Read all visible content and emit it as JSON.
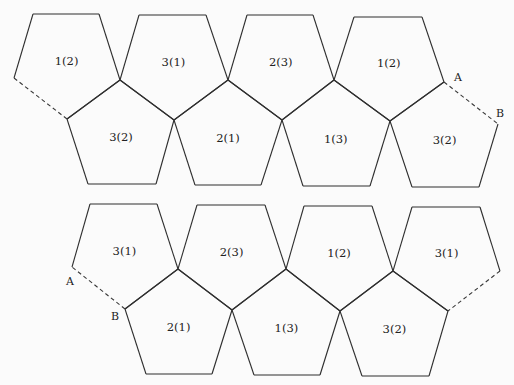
{
  "diagram": {
    "type": "pentagon-net",
    "nets": [
      {
        "id": "top-net",
        "faces": [
          {
            "label": "1(2)",
            "row": "upper",
            "points": "33,14 99,14 120,80 67,119 14,78"
          },
          {
            "label": "3(1)",
            "row": "upper",
            "points": "139,15 206,15 228,80 174,120 120,80"
          },
          {
            "label": "2(3)",
            "row": "upper",
            "points": "247,15 313,15 334,80 282,120 228,80"
          },
          {
            "label": "1(2)",
            "row": "upper",
            "points": "354,17 422,17 444,82 390,121 334,80"
          },
          {
            "label": "3(2)",
            "row": "lower",
            "points": "67,119 120,80 174,120 156,184 88,184"
          },
          {
            "label": "2(1)",
            "row": "lower",
            "points": "174,120 228,80 282,120 261,185 195,185"
          },
          {
            "label": "1(3)",
            "row": "lower",
            "points": "282,120 334,80 390,121 370,186 303,186"
          },
          {
            "label": "3(2)",
            "row": "lower",
            "points": "390,121 444,82 498,124 479,187 412,187"
          }
        ],
        "dashed_edges": [
          {
            "from": "14,78",
            "to": "67,119"
          },
          {
            "from": "444,82",
            "to": "498,124",
            "start_label": "A",
            "end_label": "B"
          }
        ]
      },
      {
        "id": "bottom-net",
        "faces": [
          {
            "label": "3(1)",
            "row": "upper",
            "points": "90,204 157,204 178,269 125,309 72,267"
          },
          {
            "label": "2(3)",
            "row": "upper",
            "points": "197,205 265,205 286,269 232,310 178,269"
          },
          {
            "label": "1(2)",
            "row": "upper",
            "points": "304,206 372,206 393,271 340,311 286,269"
          },
          {
            "label": "3(1)",
            "row": "upper",
            "points": "412,207 480,207 500,271 448,311 393,271"
          },
          {
            "label": "2(1)",
            "row": "lower",
            "points": "125,309 178,269 232,310 212,374 146,374"
          },
          {
            "label": "1(3)",
            "row": "lower",
            "points": "232,310 286,269 340,311 320,375 254,375"
          },
          {
            "label": "3(2)",
            "row": "lower",
            "points": "340,311 393,271 448,311 429,376 362,376"
          }
        ],
        "dashed_edges": [
          {
            "from": "72,267",
            "to": "125,309",
            "start_label": "A",
            "end_label": "B"
          },
          {
            "from": "448,311",
            "to": "500,271"
          }
        ]
      }
    ],
    "point_labels": [
      {
        "text": "A",
        "x": 454,
        "y": 81
      },
      {
        "text": "B",
        "x": 496,
        "y": 117
      },
      {
        "text": "A",
        "x": 66,
        "y": 285
      },
      {
        "text": "B",
        "x": 111,
        "y": 320
      }
    ]
  }
}
